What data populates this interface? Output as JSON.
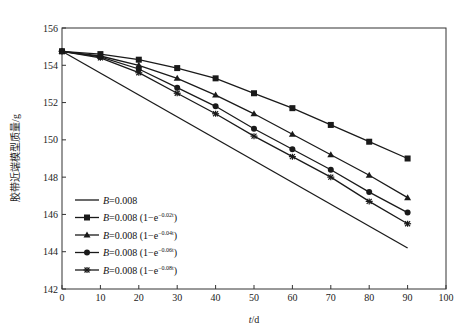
{
  "chart_data": {
    "type": "line",
    "title": "",
    "xlabel": "t/d",
    "xlabel_italic_part": "t",
    "xlabel_unit": "/d",
    "ylabel": "胶带近端模型质量/g",
    "xlim": [
      0,
      100
    ],
    "ylim": [
      142,
      156
    ],
    "xticks": [
      0,
      10,
      20,
      30,
      40,
      50,
      60,
      70,
      80,
      90,
      100
    ],
    "yticks": [
      142,
      144,
      146,
      148,
      150,
      152,
      154,
      156
    ],
    "grid": false,
    "legend_position": "lower left",
    "series": [
      {
        "name": "B=0.008",
        "legend_main": "B=0.008",
        "legend_exp": "",
        "marker": "none",
        "x": [
          0,
          90
        ],
        "values": [
          154.75,
          144.2
        ]
      },
      {
        "name": "B=0.008(1−e^(−0.02t))",
        "legend_main": "B=0.008(1−e",
        "legend_exp": "−0.02t",
        "marker": "square",
        "x": [
          0,
          10,
          20,
          30,
          40,
          50,
          60,
          70,
          80,
          90
        ],
        "values": [
          154.75,
          154.6,
          154.3,
          153.85,
          153.3,
          152.5,
          151.7,
          150.8,
          149.9,
          149.0
        ]
      },
      {
        "name": "B=0.008(1−e^(−0.04t))",
        "legend_main": "B=0.008(1−e",
        "legend_exp": "−0.04t",
        "marker": "triangle",
        "x": [
          0,
          10,
          20,
          30,
          40,
          50,
          60,
          70,
          80,
          90
        ],
        "values": [
          154.75,
          154.5,
          154.0,
          153.3,
          152.4,
          151.4,
          150.3,
          149.2,
          148.1,
          146.9
        ]
      },
      {
        "name": "B=0.008(1−e^(−0.06t))",
        "legend_main": "B=0.008(1−e",
        "legend_exp": "−0.06t",
        "marker": "circle",
        "x": [
          0,
          10,
          20,
          30,
          40,
          50,
          60,
          70,
          80,
          90
        ],
        "values": [
          154.75,
          154.45,
          153.8,
          152.8,
          151.8,
          150.6,
          149.5,
          148.4,
          147.2,
          146.1
        ]
      },
      {
        "name": "B=0.008(1−e^(−0.08t))",
        "legend_main": "B=0.008(1−e",
        "legend_exp": "−0.08t",
        "marker": "star",
        "x": [
          0,
          10,
          20,
          30,
          40,
          50,
          60,
          70,
          80,
          90
        ],
        "values": [
          154.75,
          154.4,
          153.6,
          152.5,
          151.4,
          150.2,
          149.1,
          148.0,
          146.7,
          145.5
        ]
      }
    ]
  },
  "colors": {
    "line": "#1a1a1a",
    "axis": "#333333",
    "background": "#ffffff"
  }
}
